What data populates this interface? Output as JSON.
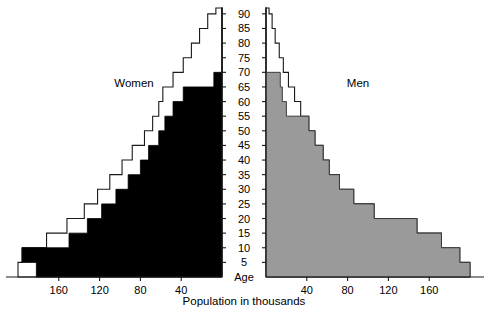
{
  "chart_data": {
    "type": "bar",
    "subtype": "population-pyramid",
    "title": "",
    "xlabel": "Population in thousands",
    "ylabel": "Age",
    "age_axis_label": "Age",
    "grid": false,
    "legend_position": "in-plot",
    "age_ticks": [
      5,
      10,
      15,
      20,
      25,
      30,
      35,
      40,
      45,
      50,
      55,
      60,
      65,
      70,
      75,
      80,
      85,
      90
    ],
    "age_range": [
      0,
      92
    ],
    "x_ticks_left": [
      160,
      120,
      80,
      40
    ],
    "x_ticks_right": [
      40,
      80,
      120,
      160
    ],
    "xlim": [
      0,
      200
    ],
    "series": [
      {
        "name": "Women",
        "side": "left",
        "color": "#000000",
        "outline_color": "#ffffff",
        "age_groups": [
          0,
          5,
          10,
          15,
          20,
          25,
          30,
          35,
          40,
          45,
          50,
          55,
          60,
          65,
          70,
          75,
          80,
          85,
          90
        ],
        "total_values": [
          200,
          196,
          172,
          152,
          135,
          122,
          110,
          98,
          88,
          76,
          68,
          62,
          58,
          48,
          38,
          30,
          22,
          14,
          6
        ],
        "highlight_values": [
          182,
          196,
          150,
          132,
          118,
          104,
          92,
          80,
          72,
          62,
          56,
          48,
          38,
          8,
          0,
          0,
          0,
          0,
          0
        ]
      },
      {
        "name": "Men",
        "side": "right",
        "color": "#9a9a9a",
        "outline_color": "#ffffff",
        "age_groups": [
          0,
          5,
          10,
          15,
          20,
          25,
          30,
          35,
          40,
          45,
          50,
          55,
          60,
          65,
          70,
          75,
          80,
          85,
          90
        ],
        "total_values": [
          200,
          190,
          172,
          148,
          106,
          86,
          72,
          62,
          56,
          48,
          42,
          34,
          28,
          22,
          17,
          13,
          9,
          6,
          3
        ],
        "highlight_values": [
          200,
          190,
          172,
          148,
          106,
          86,
          72,
          62,
          56,
          48,
          42,
          20,
          16,
          14,
          0,
          0,
          0,
          0,
          0
        ]
      }
    ]
  },
  "labels": {
    "women": "Women",
    "men": "Men",
    "age": "Age",
    "x_title": "Population in thousands"
  }
}
